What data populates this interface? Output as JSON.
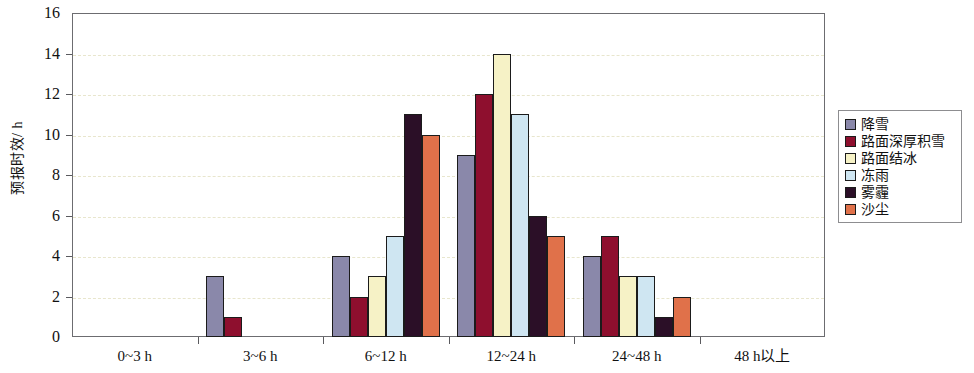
{
  "chart_data": {
    "type": "bar",
    "title": "",
    "xlabel": "",
    "ylabel": "预报时效/ h",
    "ylim": [
      0,
      16
    ],
    "ytick_step": 2,
    "yticks": [
      0,
      2,
      4,
      6,
      8,
      10,
      12,
      14,
      16
    ],
    "grid": true,
    "grid_style": "dashed",
    "legend_position": "right",
    "categories": [
      "0~3 h",
      "3~6 h",
      "6~12 h",
      "12~24 h",
      "24~48 h",
      "48 h以上"
    ],
    "series": [
      {
        "name": "降雪",
        "color": "#8a88aa",
        "values": [
          0,
          3,
          4,
          9,
          4,
          0
        ]
      },
      {
        "name": "路面深厚积雪",
        "color": "#8e0f2e",
        "values": [
          0,
          1,
          2,
          12,
          5,
          0
        ]
      },
      {
        "name": "路面结冰",
        "color": "#f6f2c6",
        "values": [
          0,
          0,
          3,
          14,
          3,
          0
        ]
      },
      {
        "name": "冻雨",
        "color": "#cfe6f2",
        "values": [
          0,
          0,
          5,
          11,
          3,
          0
        ]
      },
      {
        "name": "雾霾",
        "color": "#2b0f27",
        "values": [
          0,
          0,
          11,
          6,
          1,
          0
        ]
      },
      {
        "name": "沙尘",
        "color": "#e0714a",
        "values": [
          0,
          0,
          10,
          5,
          2,
          0
        ]
      }
    ]
  },
  "colors": {
    "axis": "#5a5a5e",
    "frame": "#6c6c70",
    "grid": "#e8e6cd",
    "bar_outline": "#1b1b1b",
    "background": "#ffffff",
    "text": "#111111"
  }
}
